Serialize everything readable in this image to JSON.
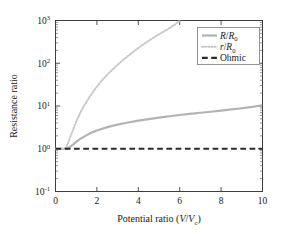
{
  "figure": {
    "background_color": "#ffffff",
    "frame_color": "#3d3d3d"
  },
  "chart_data": {
    "type": "line",
    "title": "",
    "xlabel": "Potential ratio (V/Vc)",
    "ylabel": "Resistance ratio",
    "xlabel_parts": {
      "text": "Potential ratio (",
      "italic1": "V",
      "slash": "/",
      "italic2": "V",
      "sub": "c",
      "close": ")"
    },
    "xlim": [
      0,
      10
    ],
    "ylim": [
      0.1,
      1000
    ],
    "yscale": "log",
    "xscale": "linear",
    "grid": false,
    "legend_position": "upper right",
    "xticks": [
      0,
      2,
      4,
      6,
      8,
      10
    ],
    "xtick_labels": [
      "0",
      "2",
      "4",
      "6",
      "8",
      "10"
    ],
    "yticks": [
      0.1,
      1,
      10,
      100,
      1000
    ],
    "ytick_labels": [
      "10-1",
      "100",
      "101",
      "102",
      "103"
    ],
    "ytick_mantissa": "10",
    "ytick_exponents": [
      "-1",
      "0",
      "1",
      "2",
      "3"
    ],
    "series": [
      {
        "name": "R/R0",
        "name_parts": {
          "italic1": "R",
          "slash": "/",
          "italic2": "R",
          "sub": "0"
        },
        "style": "solid",
        "color": "#b3b3b3",
        "width": 2.2,
        "x": [
          0,
          0.25,
          0.5,
          0.6,
          0.7,
          0.8,
          0.9,
          1.0,
          1.2,
          1.4,
          1.6,
          1.8,
          2.0,
          2.5,
          3.0,
          3.5,
          4.0,
          4.5,
          5.0,
          5.5,
          6.0,
          6.5,
          7.0,
          7.5,
          8.0,
          8.5,
          9.0,
          9.5,
          10.0
        ],
        "y": [
          1.0,
          1.0,
          1.0,
          1.03,
          1.1,
          1.2,
          1.32,
          1.45,
          1.7,
          1.95,
          2.2,
          2.45,
          2.68,
          3.2,
          3.68,
          4.12,
          4.55,
          4.95,
          5.35,
          5.75,
          6.15,
          6.55,
          6.95,
          7.35,
          7.8,
          8.3,
          8.85,
          9.5,
          10.4
        ]
      },
      {
        "name": "r/R0",
        "name_parts": {
          "italic1": "r",
          "slash": "/",
          "italic2": "R",
          "sub": "0"
        },
        "style": "dotted",
        "color": "#c9c9c9",
        "width": 2.0,
        "x": [
          0,
          0.25,
          0.45,
          0.5,
          0.6,
          0.7,
          0.8,
          0.9,
          1.0,
          1.2,
          1.4,
          1.6,
          1.8,
          2.0,
          2.25,
          2.5,
          2.75,
          3.0,
          3.25,
          3.5,
          3.75,
          4.0,
          4.25,
          4.5,
          4.75,
          5.0,
          5.25,
          5.5,
          5.75,
          6.0
        ],
        "y": [
          1.0,
          1.0,
          1.0,
          1.05,
          1.35,
          1.8,
          2.4,
          3.2,
          4.3,
          7.0,
          10.5,
          15.0,
          21.0,
          28.5,
          40.0,
          54.0,
          71.0,
          92.0,
          118.0,
          148.0,
          184.0,
          228.0,
          278.0,
          335.0,
          400.0,
          477.0,
          562.0,
          660.0,
          790.0,
          1000.0
        ]
      },
      {
        "name": "Ohmic",
        "style": "dashed",
        "color": "#2b2b2b",
        "width": 2.2,
        "x": [
          0,
          10
        ],
        "y": [
          1.0,
          1.0
        ]
      }
    ],
    "legend_entries": [
      {
        "label": "R/R0",
        "style": "solid",
        "color": "#b3b3b3"
      },
      {
        "label": "r/R0",
        "style": "dotted",
        "color": "#c9c9c9"
      },
      {
        "label": "Ohmic",
        "style": "dashed",
        "color": "#2b2b2b"
      }
    ],
    "legend_ohmic_label": "Ohmic"
  }
}
